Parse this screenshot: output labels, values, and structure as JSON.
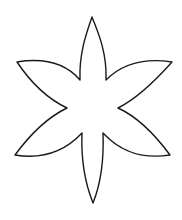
{
  "document": {
    "title": "Flower Outline",
    "type": "line-art-coloring-page",
    "canvas": {
      "width": 182,
      "height": 220,
      "background_color": "#ffffff"
    }
  },
  "artwork": {
    "name": "six-petal-flower-outline",
    "description": "Black outline drawing of a six petal flower with pointed lens shaped petals and a hollow white center",
    "stroke_color": "#1a1a1a",
    "fill_color": "#ffffff",
    "stroke_width": 1.4,
    "petal_count": 6,
    "center": {
      "x": 92,
      "y": 108
    },
    "petals": [
      {
        "name": "petal-top",
        "angle_deg": 270,
        "tip": {
          "x": 92,
          "y": 17
        },
        "notch_left": {
          "x": 80,
          "y": 80
        },
        "notch_right": {
          "x": 106,
          "y": 80
        }
      },
      {
        "name": "petal-upper-right",
        "angle_deg": 330,
        "tip": {
          "x": 172,
          "y": 62
        },
        "notch_left": {
          "x": 106,
          "y": 80
        },
        "notch_right": {
          "x": 118,
          "y": 108
        }
      },
      {
        "name": "petal-lower-right",
        "angle_deg": 30,
        "tip": {
          "x": 170,
          "y": 155
        },
        "notch_left": {
          "x": 118,
          "y": 108
        },
        "notch_right": {
          "x": 103,
          "y": 133
        }
      },
      {
        "name": "petal-bottom",
        "angle_deg": 90,
        "tip": {
          "x": 93,
          "y": 203
        },
        "notch_left": {
          "x": 103,
          "y": 133
        },
        "notch_right": {
          "x": 82,
          "y": 133
        }
      },
      {
        "name": "petal-lower-left",
        "angle_deg": 150,
        "tip": {
          "x": 15,
          "y": 155
        },
        "notch_left": {
          "x": 82,
          "y": 133
        },
        "notch_right": {
          "x": 67,
          "y": 108
        }
      },
      {
        "name": "petal-upper-left",
        "angle_deg": 210,
        "tip": {
          "x": 17,
          "y": 62
        },
        "notch_left": {
          "x": 67,
          "y": 108
        },
        "notch_right": {
          "x": 80,
          "y": 80
        }
      }
    ],
    "outline_path": "M 92 17 C 99 34 107 54 106 80 C 120 66 140 57 172 62 C 156 80 138 98 118 108 C 140 118 156 136 170 155 C 138 160 118 149 103 133 C 104 159 101 183 93 203 C 85 183 81 158 82 133 C 67 149 46 160 15 155 C 29 136 46 118 67 108 C 46 98 29 80 17 62 C 48 57 68 66 80 80 C 79 54 86 34 92 17 Z"
  }
}
